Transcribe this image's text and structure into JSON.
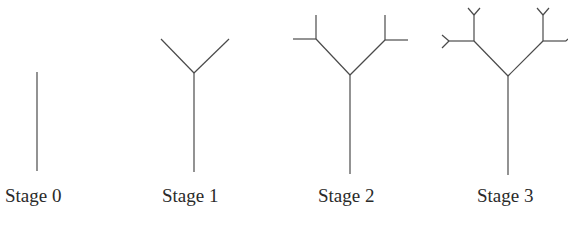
{
  "figure": {
    "type": "fractal-tree-stages",
    "stroke_color": "#4a4a4a",
    "stages": [
      {
        "label": "Stage 0",
        "level": 0
      },
      {
        "label": "Stage 1",
        "level": 1
      },
      {
        "label": "Stage 2",
        "level": 2
      },
      {
        "label": "Stage 3",
        "level": 3
      }
    ]
  }
}
